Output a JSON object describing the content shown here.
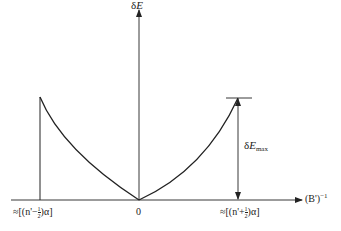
{
  "diagram": {
    "y_axis_label_prefix": "δ",
    "y_axis_label_var": "E",
    "x_axis_label_base": "(B')",
    "x_axis_label_exp": "−1",
    "origin_label": "0",
    "left_tick_label": {
      "prefix": "≈[(n'−",
      "frac_num": "1",
      "frac_den": "2",
      "suffix": ")α]"
    },
    "right_tick_label": {
      "prefix": "≈[(n'+",
      "frac_num": "1",
      "frac_den": "2",
      "suffix": ")α]"
    },
    "max_annotation": {
      "prefix": "δ",
      "var": "E",
      "sub": "max"
    },
    "stroke_color": "#222222"
  }
}
